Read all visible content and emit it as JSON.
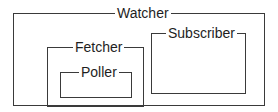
{
  "diagram": {
    "type": "nested-containment",
    "line_color": "#3a3a3a",
    "text_color": "#1e1e1e",
    "background": "#ffffff",
    "nodes": {
      "watcher": {
        "label": "Watcher",
        "children": [
          "fetcher",
          "subscriber"
        ]
      },
      "fetcher": {
        "label": "Fetcher",
        "children": [
          "poller"
        ]
      },
      "poller": {
        "label": "Poller",
        "children": []
      },
      "subscriber": {
        "label": "Subscriber",
        "children": []
      }
    }
  }
}
